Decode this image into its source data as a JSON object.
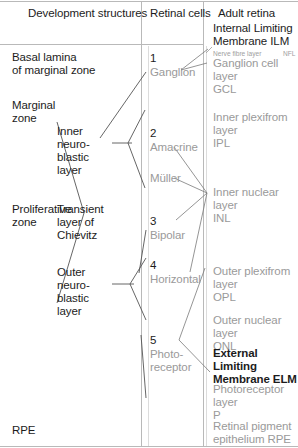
{
  "headers": {
    "left": "Development structures",
    "middle": "Retinal cells",
    "right": "Adult retina"
  },
  "development_structures": [
    {
      "id": "basal-lamina",
      "text": "Basal lamina\nof marginal zone"
    },
    {
      "id": "marginal-zone",
      "text": "Marginal\nzone"
    },
    {
      "id": "proliferative-zone",
      "text": "Proliferative\nzone"
    },
    {
      "id": "inner-neuroblastic-layer",
      "text": "Inner\nneuro-\nblastic\nlayer"
    },
    {
      "id": "transient-layer-of-chievitz",
      "text": "Transient\nlayer of\nChievitz"
    },
    {
      "id": "outer-neuroblastic-layer",
      "text": "Outer\nneuro-\nblastic\nlayer"
    },
    {
      "id": "rpe",
      "text": "RPE"
    }
  ],
  "retinal_cells": [
    {
      "number": "1",
      "name": "Ganglion"
    },
    {
      "number": "2",
      "name": "Amacrine"
    },
    {
      "number": "",
      "name": "Müller"
    },
    {
      "number": "3",
      "name": "Bipolar"
    },
    {
      "number": "4",
      "name": "Horizontal"
    },
    {
      "number": "5",
      "name": "Photo-\nreceptor"
    }
  ],
  "adult_retina": [
    {
      "id": "ilm",
      "text": "Internal Limiting\nMembrane ILM",
      "style": "dark"
    },
    {
      "id": "nfl",
      "text": "Nerve fibre layer",
      "abbr": "NFL",
      "style": "tiny"
    },
    {
      "id": "gcl",
      "text": "Ganglion cell layer\nGCL",
      "style": "gray"
    },
    {
      "id": "ipl",
      "text": "Inner plexifrom layer\nIPL",
      "style": "gray"
    },
    {
      "id": "inl",
      "text": "Inner nuclear layer\nINL",
      "style": "gray"
    },
    {
      "id": "opl",
      "text": "Outer plexifrom layer\nOPL",
      "style": "gray"
    },
    {
      "id": "onl",
      "text": "Outer nuclear layer\nONL",
      "style": "gray"
    },
    {
      "id": "elm",
      "text": "External Limiting\nMembrane ELM",
      "style": "dark"
    },
    {
      "id": "prl",
      "text": "Photoreceptor layer\nP",
      "style": "gray"
    },
    {
      "id": "rpe",
      "text": "Retinal pigment\nepithelium   RPE",
      "style": "gray"
    }
  ],
  "colors": {
    "text_dark": "#1c1c1c",
    "text_gray": "#9a9a9a",
    "rule": "#b9b9b9",
    "divider": "#b9b9b9",
    "connector_dark": "#4a4a4a",
    "connector_gray": "#bdbdbd"
  }
}
